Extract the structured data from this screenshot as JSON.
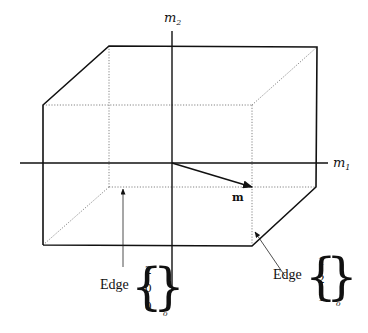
{
  "diagram": {
    "title": "",
    "axes": {
      "horizontal": {
        "name": "m",
        "subscript": "1"
      },
      "vertical": {
        "name": "m",
        "subscript": "2"
      }
    },
    "vector": {
      "label": "m"
    },
    "edges": [
      {
        "word": "Edge",
        "components": [
          "2",
          "0",
          "0"
        ],
        "subscript": "o"
      },
      {
        "word": "Edge",
        "components": [
          "1",
          "2",
          "1"
        ],
        "subscript": "o"
      }
    ]
  }
}
